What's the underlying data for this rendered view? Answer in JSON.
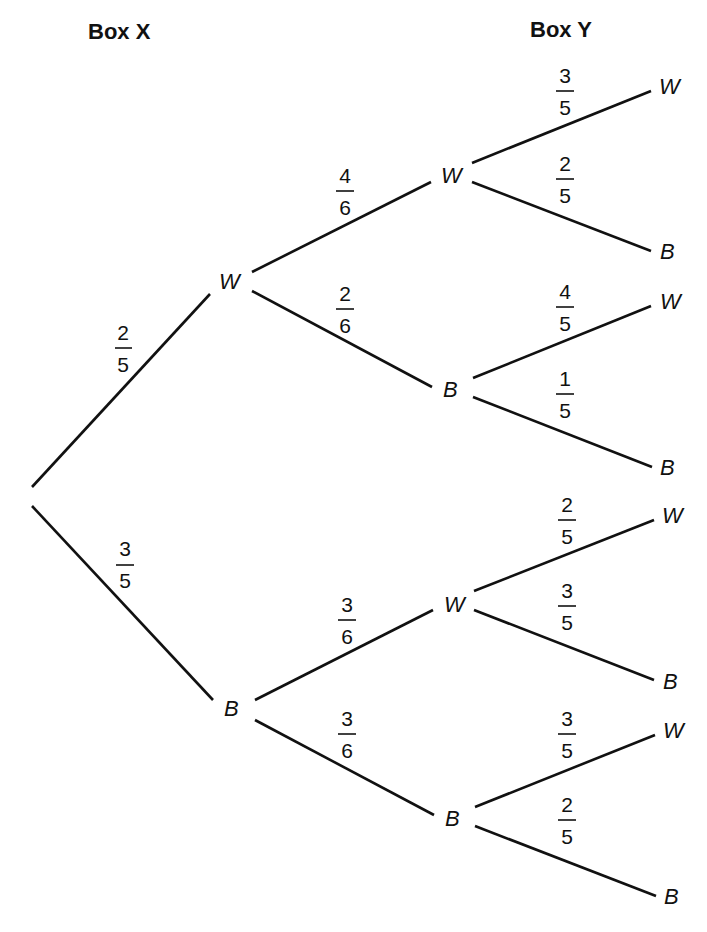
{
  "headers": {
    "box_x": "Box X",
    "box_y": "Box Y"
  },
  "level1": {
    "W": {
      "label": "W",
      "prob": {
        "num": "2",
        "den": "5"
      }
    },
    "B": {
      "label": "B",
      "prob": {
        "num": "3",
        "den": "5"
      }
    }
  },
  "level2": {
    "WW": {
      "label": "W",
      "prob": {
        "num": "4",
        "den": "6"
      }
    },
    "WB": {
      "label": "B",
      "prob": {
        "num": "2",
        "den": "6"
      }
    },
    "BW": {
      "label": "W",
      "prob": {
        "num": "3",
        "den": "6"
      }
    },
    "BB": {
      "label": "B",
      "prob": {
        "num": "3",
        "den": "6"
      }
    }
  },
  "level3": {
    "WWW": {
      "label": "W",
      "prob": {
        "num": "3",
        "den": "5"
      }
    },
    "WWB": {
      "label": "B",
      "prob": {
        "num": "2",
        "den": "5"
      }
    },
    "WBW": {
      "label": "W",
      "prob": {
        "num": "4",
        "den": "5"
      }
    },
    "WBB": {
      "label": "B",
      "prob": {
        "num": "1",
        "den": "5"
      }
    },
    "BWW": {
      "label": "W",
      "prob": {
        "num": "2",
        "den": "5"
      }
    },
    "BWB": {
      "label": "B",
      "prob": {
        "num": "3",
        "den": "5"
      }
    },
    "BBW": {
      "label": "W",
      "prob": {
        "num": "3",
        "den": "5"
      }
    },
    "BBB": {
      "label": "B",
      "prob": {
        "num": "2",
        "den": "5"
      }
    }
  }
}
